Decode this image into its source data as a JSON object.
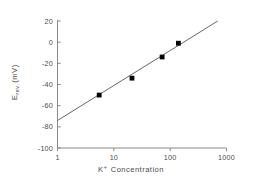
{
  "chart_data": {
    "type": "scatter",
    "title": "",
    "xlabel": "K+ Concentration",
    "xlabel_parts": {
      "base": "K",
      "superscript": "+",
      "rest": "Concentration"
    },
    "ylabel": "Erev (mV)",
    "ylabel_parts": {
      "base": "E",
      "subscript": "rev",
      "units": "(mV)"
    },
    "xscale": "log",
    "yscale": "linear",
    "xlim": [
      1,
      1000
    ],
    "ylim": [
      -100,
      20
    ],
    "grid": false,
    "legend": null,
    "xticks": [
      1,
      10,
      100,
      1000
    ],
    "xtick_labels": [
      "1",
      "10",
      "100",
      "1000"
    ],
    "yticks": [
      20,
      0,
      -20,
      -40,
      -60,
      -80,
      -100
    ],
    "ytick_labels": [
      "20",
      "0",
      "-20",
      "-40",
      "-60",
      "-80",
      "-100"
    ],
    "series": [
      {
        "name": "measured",
        "type": "scatter",
        "marker": "filled-square",
        "color": "#000000",
        "points": [
          {
            "x": 5.5,
            "y": -50
          },
          {
            "x": 21,
            "y": -34
          },
          {
            "x": 72,
            "y": -14
          },
          {
            "x": 140,
            "y": -1
          }
        ]
      },
      {
        "name": "fit-line",
        "type": "line",
        "color": "#555555",
        "points": [
          {
            "x": 1,
            "y": -74
          },
          {
            "x": 700,
            "y": 20
          }
        ]
      }
    ]
  },
  "axis_style": {
    "axis_color": "#8a8a8a",
    "text_color": "#4a4a4a",
    "marker_color": "#000000",
    "line_color": "#555555",
    "background": "#ffffff"
  }
}
